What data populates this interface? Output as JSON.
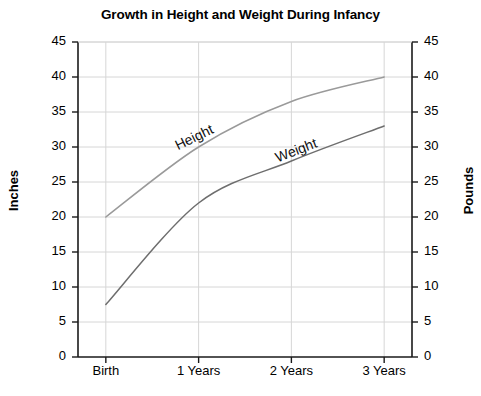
{
  "chart_data": {
    "type": "line",
    "title": "Growth in Height and Weight During Infancy",
    "xlabel": "",
    "ylabel": "Inches",
    "ylabel_right": "Pounds",
    "categories": [
      "Birth",
      "1 Years",
      "2 Years",
      "3 Years"
    ],
    "x": [
      0,
      1,
      2,
      3
    ],
    "ylim": [
      0,
      45
    ],
    "ylim_right": [
      0,
      45
    ],
    "yticks": [
      0,
      5,
      10,
      15,
      20,
      25,
      30,
      35,
      40,
      45
    ],
    "yticks_right": [
      0,
      5,
      10,
      15,
      20,
      25,
      30,
      35,
      40,
      45
    ],
    "grid": true,
    "legend": "inline-labels",
    "series": [
      {
        "name": "Height",
        "axis": "left",
        "unit": "Inches",
        "color": "#9a9a9a",
        "values": [
          20,
          30,
          36.5,
          40
        ]
      },
      {
        "name": "Weight",
        "axis": "right",
        "unit": "Pounds",
        "color": "#6e6e6e",
        "values": [
          7.5,
          22,
          28,
          33
        ]
      }
    ],
    "annotations": [
      {
        "text": "Height",
        "series": "Height",
        "x": 0.95,
        "y": 31.5,
        "rotation": -26
      },
      {
        "text": "Weight",
        "series": "Weight",
        "x": 2.05,
        "y": 29.6,
        "rotation": -21
      }
    ]
  },
  "axes": {
    "left_title": "Inches",
    "right_title": "Pounds",
    "tick_labels": [
      "45",
      "40",
      "35",
      "30",
      "25",
      "20",
      "15",
      "10",
      "5",
      "0"
    ],
    "x_tick_labels": [
      "Birth",
      "1 Years",
      "2 Years",
      "3 Years"
    ]
  },
  "colors": {
    "height_line": "#9a9a9a",
    "weight_line": "#6e6e6e",
    "grid": "#d6d6d6",
    "axis": "#1a1a1a",
    "text": "#000000"
  }
}
